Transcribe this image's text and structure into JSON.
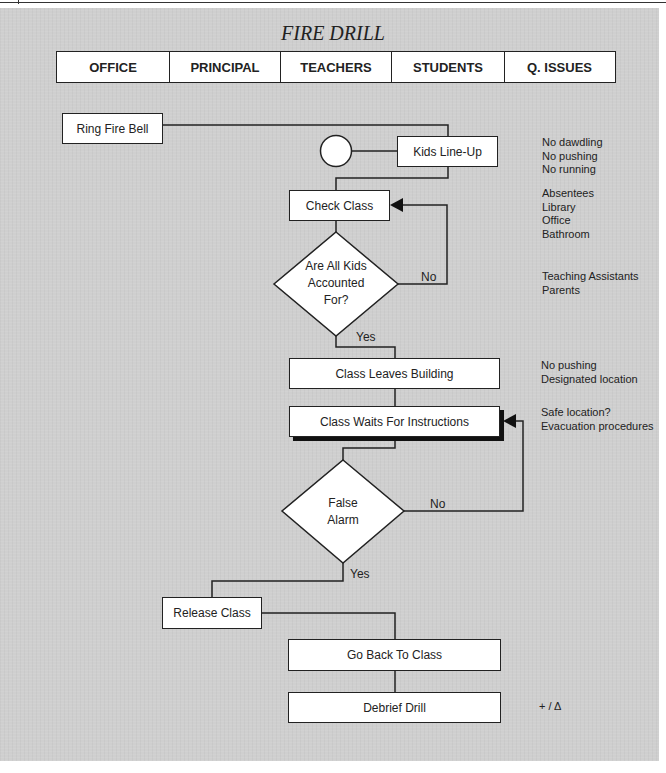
{
  "title": "FIRE DRILL",
  "lanes": [
    {
      "label": "OFFICE"
    },
    {
      "label": "PRINCIPAL"
    },
    {
      "label": "TEACHERS"
    },
    {
      "label": "STUDENTS"
    },
    {
      "label": "Q. ISSUES"
    }
  ],
  "nodes": {
    "ring_fire_bell": "Ring Fire Bell",
    "kids_line_up": "Kids Line-Up",
    "check_class": "Check Class",
    "are_all_kids_accounted_for": [
      "Are All Kids",
      "Accounted",
      "For?"
    ],
    "class_leaves_building": "Class Leaves Building",
    "class_waits_for_instructions": "Class Waits For Instructions",
    "false_alarm": [
      "False",
      "Alarm"
    ],
    "release_class": "Release Class",
    "go_back_to_class": "Go Back To Class",
    "debrief_drill": "Debrief Drill"
  },
  "edges": {
    "accounted_no": "No",
    "accounted_yes": "Yes",
    "false_alarm_no": "No",
    "false_alarm_yes": "Yes"
  },
  "issues": {
    "line_up": [
      "No dawdling",
      "No pushing",
      "No running"
    ],
    "check_class": [
      "Absentees",
      "Library",
      "Office",
      "Bathroom"
    ],
    "accounted": [
      "Teaching Assistants",
      "Parents"
    ],
    "leaves_building": [
      "No pushing",
      "Designated location"
    ],
    "waits": [
      "Safe location?",
      "Evacuation procedures"
    ],
    "debrief": [
      "+ / Δ"
    ]
  },
  "colors": {
    "background": "#cfcfcf",
    "box_fill": "#ffffff",
    "stroke": "#222222"
  }
}
